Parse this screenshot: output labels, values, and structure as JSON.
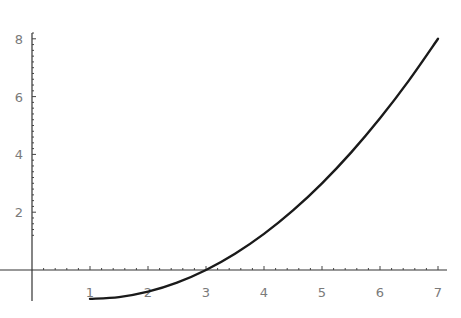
{
  "chart_data": {
    "type": "line",
    "title": "",
    "xlabel": "",
    "ylabel": "",
    "xlim": [
      0,
      7
    ],
    "ylim": [
      -1.05,
      8.2
    ],
    "grid": false,
    "legend": null,
    "x_ticks": [
      1,
      2,
      3,
      4,
      5,
      6,
      7
    ],
    "y_ticks": [
      2,
      4,
      6,
      8
    ],
    "x_minor_step": 0.2,
    "y_minor_step": 0.2,
    "series": [
      {
        "name": "f(x) = (x-1)^2/4 - 1",
        "x": [
          1,
          1.5,
          2,
          2.5,
          3,
          3.5,
          4,
          4.5,
          5,
          5.5,
          6,
          6.5,
          7
        ],
        "values": [
          -1,
          -0.9375,
          -0.75,
          -0.4375,
          0,
          0.5625,
          1.25,
          2.0625,
          3,
          4.0625,
          5.25,
          6.5625,
          8
        ],
        "color": "#1a1a1a"
      }
    ]
  },
  "layout": {
    "origin_px": [
      32,
      270
    ],
    "x_px_per_unit": 58,
    "y_px_per_unit": 28.9,
    "x_axis_range_px": [
      0,
      447
    ],
    "y_axis_range_px": [
      33,
      301
    ]
  }
}
